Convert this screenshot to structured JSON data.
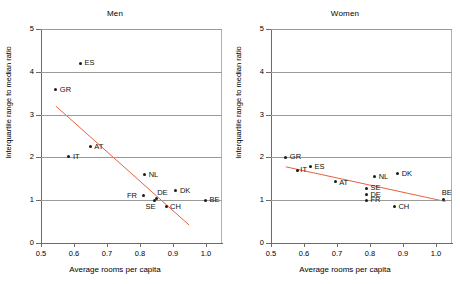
{
  "figure": {
    "width": 460,
    "height": 284,
    "background": "#ffffff",
    "point_color": "#1a1a1a",
    "fitline_color": "#e8603c",
    "gridline_color": "#9a9a9a",
    "axis_color": "#6b6b6b"
  },
  "axes": {
    "xlabel": "Average rooms per capita",
    "ylabel": "Interquartile range to median ratio",
    "xticks": [
      "0.5",
      "0.6",
      "0.7",
      "0.8",
      "0.9",
      "1.0"
    ],
    "xtick_values": [
      0.5,
      0.6,
      0.7,
      0.8,
      0.9,
      1.0
    ],
    "yticks": [
      "0",
      "1",
      "2",
      "3",
      "4",
      "5"
    ],
    "ytick_values": [
      0,
      1,
      2,
      3,
      4,
      5
    ],
    "xlim": [
      0.5,
      1.05
    ],
    "ylim": [
      0,
      5
    ],
    "grid": "horizontal"
  },
  "chart_data": [
    {
      "type": "scatter",
      "title": "Men",
      "xlabel": "Average rooms per capita",
      "ylabel": "Interquartile range to median ratio",
      "xlim": [
        0.5,
        1.05
      ],
      "ylim": [
        0,
        5
      ],
      "grid": true,
      "legend": "none",
      "points": [
        {
          "label": "ES",
          "x": 0.62,
          "y": 4.2,
          "label_dx": 4,
          "label_dy": -4
        },
        {
          "label": "GR",
          "x": 0.545,
          "y": 3.58,
          "label_dx": 4,
          "label_dy": -4
        },
        {
          "label": "AT",
          "x": 0.65,
          "y": 2.25,
          "label_dx": 4,
          "label_dy": -4
        },
        {
          "label": "IT",
          "x": 0.585,
          "y": 2.02,
          "label_dx": 4,
          "label_dy": -4
        },
        {
          "label": "NL",
          "x": 0.815,
          "y": 1.6,
          "label_dx": 4,
          "label_dy": -4
        },
        {
          "label": "DK",
          "x": 0.91,
          "y": 1.22,
          "label_dx": 4,
          "label_dy": -4
        },
        {
          "label": "FR",
          "x": 0.81,
          "y": 1.1,
          "label_dx": -16,
          "label_dy": -4
        },
        {
          "label": "DE",
          "x": 0.85,
          "y": 1.05,
          "label_dx": 1,
          "label_dy": -9
        },
        {
          "label": "SE",
          "x": 0.845,
          "y": 1.0,
          "label_dx": -9,
          "label_dy": 3
        },
        {
          "label": "CH",
          "x": 0.88,
          "y": 0.85,
          "label_dx": 4,
          "label_dy": -4
        },
        {
          "label": "BE",
          "x": 1.0,
          "y": 1.0,
          "label_dx": 4,
          "label_dy": -4
        }
      ],
      "fitline": {
        "x1": 0.545,
        "y1": 3.2,
        "x2": 0.95,
        "y2": 0.42,
        "color": "#e8603c"
      }
    },
    {
      "type": "scatter",
      "title": "Women",
      "xlabel": "Average rooms per capita",
      "ylabel": "Interquartile range to median ratio",
      "xlim": [
        0.5,
        1.05
      ],
      "ylim": [
        0,
        5
      ],
      "grid": true,
      "legend": "none",
      "points": [
        {
          "label": "GR",
          "x": 0.545,
          "y": 2.0,
          "label_dx": 4,
          "label_dy": -4
        },
        {
          "label": "ES",
          "x": 0.62,
          "y": 1.78,
          "label_dx": 4,
          "label_dy": -4
        },
        {
          "label": "IT",
          "x": 0.58,
          "y": 1.7,
          "label_dx": 3,
          "label_dy": 0
        },
        {
          "label": "AT",
          "x": 0.695,
          "y": 1.43,
          "label_dx": 4,
          "label_dy": -3
        },
        {
          "label": "NL",
          "x": 0.815,
          "y": 1.55,
          "label_dx": 4,
          "label_dy": -4
        },
        {
          "label": "DK",
          "x": 0.885,
          "y": 1.62,
          "label_dx": 4,
          "label_dy": -4
        },
        {
          "label": "SE",
          "x": 0.79,
          "y": 1.28,
          "label_dx": 4,
          "label_dy": -4
        },
        {
          "label": "DE",
          "x": 0.79,
          "y": 1.13,
          "label_dx": 4,
          "label_dy": -4
        },
        {
          "label": "FR",
          "x": 0.79,
          "y": 1.0,
          "label_dx": 4,
          "label_dy": -4
        },
        {
          "label": "CH",
          "x": 0.875,
          "y": 0.85,
          "label_dx": 4,
          "label_dy": -4
        },
        {
          "label": "BE",
          "x": 1.025,
          "y": 1.02,
          "label_dx": -2,
          "label_dy": -10
        }
      ],
      "fitline": {
        "x1": 0.545,
        "y1": 1.78,
        "x2": 1.03,
        "y2": 0.97,
        "color": "#e8603c"
      }
    }
  ]
}
